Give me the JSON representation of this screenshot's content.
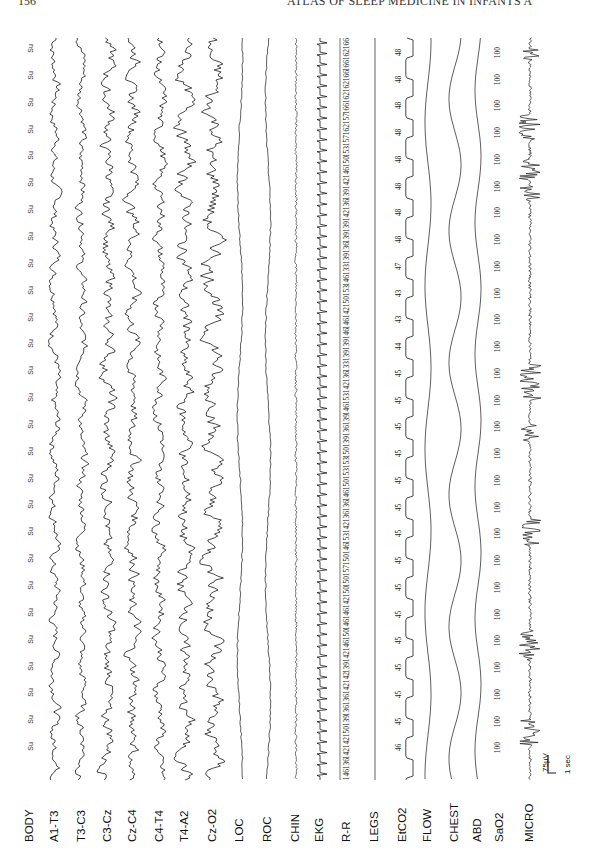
{
  "page": {
    "page_number": "156",
    "running_head": "ATLAS OF SLEEP MEDICINE IN INFANTS A"
  },
  "channels": [
    {
      "label": "BODY",
      "x": 30
    },
    {
      "label": "A1-T3",
      "x": 55
    },
    {
      "label": "T3-C3",
      "x": 82
    },
    {
      "label": "C3-Cz",
      "x": 108
    },
    {
      "label": "Cz-C4",
      "x": 133
    },
    {
      "label": "C4-T4",
      "x": 160
    },
    {
      "label": "T4-A2",
      "x": 185
    },
    {
      "label": "Cz-O2",
      "x": 213
    },
    {
      "label": "LOC",
      "x": 240
    },
    {
      "label": "ROC",
      "x": 268
    },
    {
      "label": "CHIN",
      "x": 296
    },
    {
      "label": "EKG",
      "x": 320
    },
    {
      "label": "R-R",
      "x": 347
    },
    {
      "label": "LEGS",
      "x": 375
    },
    {
      "label": "EtCO2",
      "x": 403
    },
    {
      "label": "FLOW",
      "x": 428
    },
    {
      "label": "CHEST",
      "x": 455
    },
    {
      "label": "ABD",
      "x": 478
    },
    {
      "label": "SaO2",
      "x": 500
    },
    {
      "label": "MICRO",
      "x": 530
    }
  ],
  "scale_bar": {
    "amplitude": "75µV",
    "time": "1 sec"
  },
  "chart_data": {
    "type": "line",
    "orientation": "vertical traces, time runs top to bottom",
    "channels": [
      "BODY",
      "A1-T3",
      "T3-C3",
      "C3-Cz",
      "Cz-C4",
      "C4-T4",
      "T4-A2",
      "Cz-O2",
      "LOC",
      "ROC",
      "CHIN",
      "EKG",
      "R-R",
      "LEGS",
      "EtCO2",
      "FLOW",
      "CHEST",
      "ABD",
      "SaO2",
      "MICRO"
    ],
    "body_position": [
      "Su",
      "Su",
      "Su",
      "Su",
      "Su",
      "Su",
      "Su",
      "Su",
      "Su",
      "Su",
      "Su",
      "Su",
      "Su",
      "Su",
      "Su",
      "Su",
      "Su",
      "Su",
      "Su",
      "Su",
      "Su",
      "Su",
      "Su",
      "Su",
      "Su",
      "Su",
      "Su"
    ],
    "rr_values": [
      166,
      162,
      166,
      166,
      162,
      162,
      166,
      157,
      162,
      157,
      153,
      150,
      146,
      142,
      139,
      136,
      142,
      139,
      139,
      136,
      139,
      133,
      146,
      153,
      150,
      142,
      146,
      146,
      139,
      139,
      133,
      136,
      142,
      153,
      146,
      139,
      136,
      139,
      150,
      153,
      153,
      150,
      146,
      136,
      136,
      142,
      153,
      146,
      150,
      157,
      150,
      150,
      142,
      146,
      146,
      150,
      146,
      142,
      139,
      142,
      142,
      136,
      136,
      139,
      150,
      142,
      142,
      136,
      146
    ],
    "etco2_values": [
      48,
      48,
      48,
      48,
      48,
      48,
      48,
      48,
      47,
      43,
      43,
      44,
      45,
      45,
      45,
      45,
      45,
      45,
      45,
      45,
      45,
      45,
      45,
      45,
      45,
      45,
      46
    ],
    "sao2_values": [
      100,
      100,
      100,
      100,
      100,
      100,
      100,
      100,
      100,
      100,
      100,
      100,
      100,
      100,
      100,
      100,
      100,
      100,
      100,
      100,
      100,
      100,
      100,
      100,
      100,
      100,
      100
    ],
    "scale": {
      "amplitude": "75µV",
      "time": "1 sec"
    },
    "xlabel": "",
    "ylabel": ""
  }
}
